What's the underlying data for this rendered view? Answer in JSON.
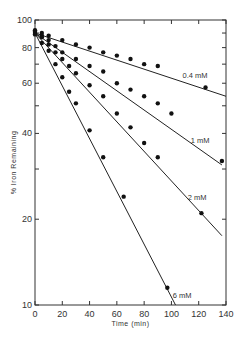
{
  "chart_data": {
    "type": "scatter",
    "title": "",
    "xlabel": "Time (min)",
    "ylabel": "% Iron Remaining",
    "xlim": [
      0,
      140
    ],
    "ylim": [
      10,
      100
    ],
    "yscale": "log",
    "grid": false,
    "legend": "inline line labels",
    "x_ticks": [
      0,
      20,
      40,
      60,
      80,
      100,
      120,
      140
    ],
    "y_ticks": [
      10,
      20,
      40,
      60,
      80,
      100
    ],
    "series": [
      {
        "name": "0.4 mM",
        "points": [
          [
            0,
            92
          ],
          [
            5,
            90
          ],
          [
            10,
            88
          ],
          [
            20,
            85
          ],
          [
            30,
            82
          ],
          [
            40,
            80
          ],
          [
            50,
            77
          ],
          [
            60,
            75
          ],
          [
            70,
            73
          ],
          [
            80,
            70
          ],
          [
            90,
            69
          ],
          [
            125,
            58
          ]
        ],
        "fit": [
          [
            0,
            90
          ],
          [
            140,
            54
          ]
        ]
      },
      {
        "name": "1 mM",
        "points": [
          [
            0,
            91
          ],
          [
            5,
            88
          ],
          [
            10,
            85
          ],
          [
            15,
            81
          ],
          [
            20,
            77
          ],
          [
            30,
            73
          ],
          [
            40,
            69
          ],
          [
            50,
            66
          ],
          [
            60,
            60
          ],
          [
            70,
            57
          ],
          [
            80,
            54
          ],
          [
            90,
            51
          ],
          [
            100,
            47
          ],
          [
            137,
            32
          ]
        ],
        "fit": [
          [
            0,
            90
          ],
          [
            137,
            31
          ]
        ]
      },
      {
        "name": "2 mM",
        "points": [
          [
            0,
            90
          ],
          [
            5,
            87
          ],
          [
            10,
            82
          ],
          [
            15,
            77
          ],
          [
            20,
            73
          ],
          [
            25,
            69
          ],
          [
            30,
            65
          ],
          [
            40,
            59
          ],
          [
            50,
            54
          ],
          [
            60,
            47
          ],
          [
            70,
            42
          ],
          [
            80,
            37
          ],
          [
            90,
            33
          ],
          [
            122,
            21
          ]
        ],
        "fit": [
          [
            0,
            90
          ],
          [
            137,
            17.5
          ]
        ]
      },
      {
        "name": "6 mM",
        "points": [
          [
            0,
            89
          ],
          [
            5,
            83
          ],
          [
            10,
            78
          ],
          [
            15,
            70
          ],
          [
            20,
            63
          ],
          [
            25,
            56
          ],
          [
            30,
            51
          ],
          [
            40,
            41
          ],
          [
            50,
            33
          ],
          [
            65,
            24
          ],
          [
            97,
            11.5
          ]
        ],
        "fit": [
          [
            0,
            90
          ],
          [
            103,
            10
          ]
        ]
      }
    ]
  }
}
